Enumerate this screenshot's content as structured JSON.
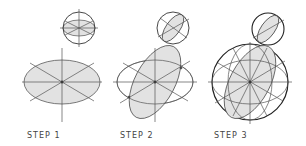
{
  "diagram": {
    "type": "construction-steps",
    "colors": {
      "line": "#555555",
      "fill": "#e2e2e2",
      "thick": "#222222"
    },
    "steps": [
      {
        "label": "STEP 1"
      },
      {
        "label": "STEP 2"
      },
      {
        "label": "STEP 3"
      }
    ]
  }
}
